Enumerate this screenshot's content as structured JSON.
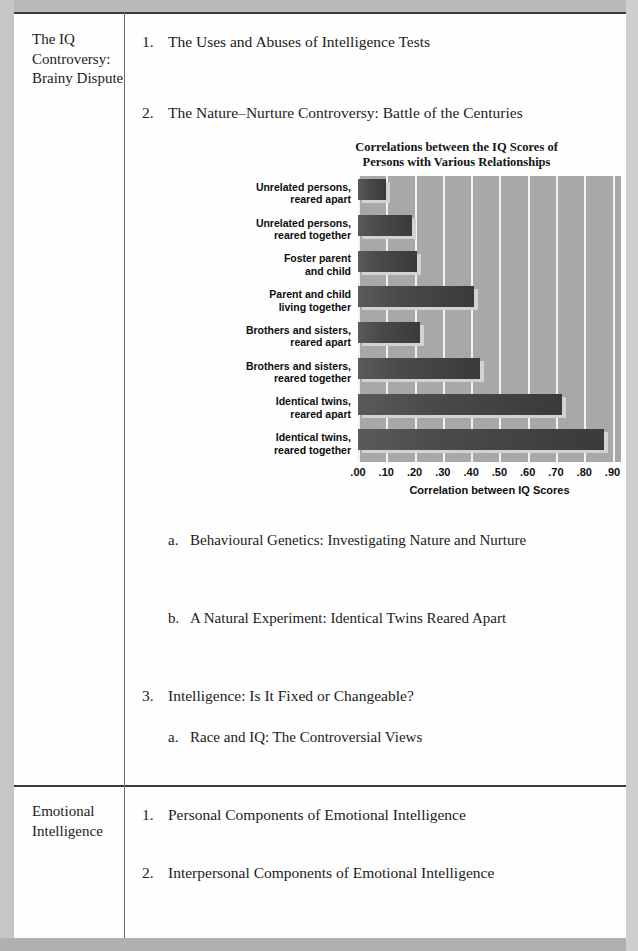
{
  "sections": [
    {
      "label": "The IQ Controversy: Brainy Dispute",
      "entries": [
        {
          "num": "1.",
          "text": "The Uses and Abuses of Intelligence Tests",
          "level": 1,
          "top": 20
        },
        {
          "num": "2.",
          "text": "The Nature–Nurture Controversy: Battle of the Centuries",
          "level": 1,
          "top": 91
        },
        {
          "num": "a.",
          "text": "Behavioural Genetics: Investigating Nature and Nurture",
          "level": 2,
          "top": 518
        },
        {
          "num": "b.",
          "text": "A Natural Experiment: Identical Twins Reared Apart",
          "level": 2,
          "top": 596
        },
        {
          "num": "3.",
          "text": "Intelligence: Is It Fixed or Changeable?",
          "level": 1,
          "top": 674
        },
        {
          "num": "a.",
          "text": "Race and IQ: The Controversial Views",
          "level": 2,
          "top": 715
        }
      ]
    },
    {
      "label": "Emotional Intelligence",
      "entries": [
        {
          "num": "1.",
          "text": "Personal Components of Emotional Intelligence",
          "level": 1,
          "top": 793
        },
        {
          "num": "2.",
          "text": "Interpersonal Components of Emotional Intelligence",
          "level": 1,
          "top": 851
        }
      ]
    }
  ],
  "chart_data": {
    "type": "bar",
    "orientation": "horizontal",
    "title": "Correlations between the IQ Scores of Persons with Various Relationships",
    "title_line1": "Correlations between the IQ Scores of",
    "title_line2": "Persons with Various Relationships",
    "xlabel": "Correlation between IQ Scores",
    "ylabel": "",
    "xlim": [
      0.0,
      0.93
    ],
    "tick_labels": [
      ".00",
      ".10",
      ".20",
      ".30",
      ".40",
      ".50",
      ".60",
      ".70",
      ".80",
      ".90"
    ],
    "tick_values": [
      0.0,
      0.1,
      0.2,
      0.3,
      0.4,
      0.5,
      0.6,
      0.7,
      0.8,
      0.9
    ],
    "grid": true,
    "legend": "none",
    "categories": [
      "Unrelated persons, reared apart",
      "Unrelated persons, reared together",
      "Foster parent and child",
      "Parent and child living together",
      "Brothers and sisters, reared apart",
      "Brothers and sisters, reared together",
      "Identical twins, reared apart",
      "Identical twins, reared together"
    ],
    "category_lines": [
      [
        "Unrelated persons,",
        "reared apart"
      ],
      [
        "Unrelated persons,",
        "reared together"
      ],
      [
        "Foster parent",
        "and child"
      ],
      [
        "Parent and child",
        "living together"
      ],
      [
        "Brothers and sisters,",
        "reared apart"
      ],
      [
        "Brothers and sisters,",
        "reared together"
      ],
      [
        "Identical twins,",
        "reared apart"
      ],
      [
        "Identical twins,",
        "reared together"
      ]
    ],
    "values": [
      0.1,
      0.19,
      0.21,
      0.41,
      0.22,
      0.43,
      0.72,
      0.87
    ],
    "bar_color": "#3f3f3f",
    "plot_background": "#a8a8a8",
    "gridline_color": "#f2f2f2",
    "shadow_color": "#d2d2d2"
  }
}
